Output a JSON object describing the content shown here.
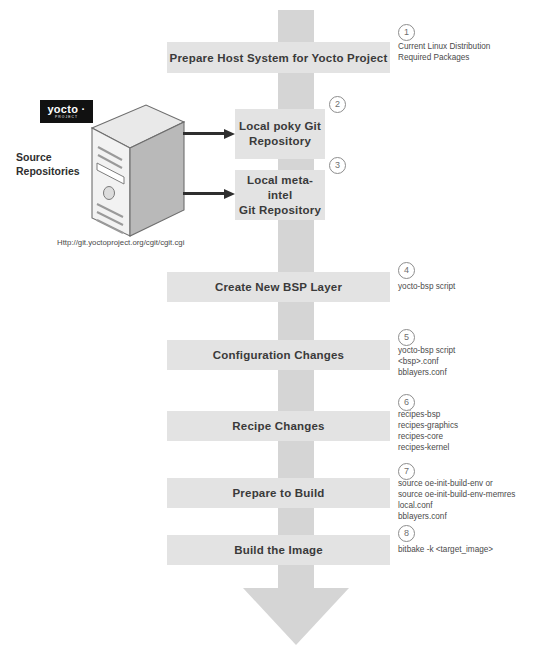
{
  "diagram": {
    "colors": {
      "spine": "#d5d5d5",
      "box": "#e3e3e3",
      "text": "#3a3a3a",
      "annotation": "#4a4a4a",
      "arrow": "#2f2f2f",
      "logo_bg": "#111111"
    }
  },
  "source": {
    "logo_word": "yocto ·",
    "logo_sub": "PROJECT",
    "label": "Source\nRepositories",
    "label_line1": "Source",
    "label_line2": "Repositories",
    "url": "Http://git.yoctoproject.org/cgit/cgit.cgi",
    "server_icon": "server-tower-icon"
  },
  "steps": [
    {
      "number": "1",
      "label": "Prepare Host System for Yocto Project",
      "kind": "wide",
      "annotations": [
        "Current Linux Distribution",
        "Required Packages"
      ]
    },
    {
      "number": "2",
      "label": "Local poky Git Repository",
      "label_lines": [
        "Local poky Git",
        "Repository"
      ],
      "kind": "repo",
      "annotations": []
    },
    {
      "number": "3",
      "label": "Local meta-intel Git Repository",
      "label_lines": [
        "Local meta-intel",
        "Git Repository"
      ],
      "kind": "repo",
      "annotations": []
    },
    {
      "number": "4",
      "label": "Create New BSP Layer",
      "kind": "mid",
      "annotations": [
        "yocto-bsp script"
      ]
    },
    {
      "number": "5",
      "label": "Configuration Changes",
      "kind": "mid",
      "annotations": [
        "yocto-bsp script",
        "<bsp>.conf",
        "bblayers.conf"
      ]
    },
    {
      "number": "6",
      "label": "Recipe Changes",
      "kind": "mid",
      "annotations": [
        "recipes-bsp",
        "recipes-graphics",
        "recipes-core",
        "recipes-kernel"
      ]
    },
    {
      "number": "7",
      "label": "Prepare to Build",
      "kind": "mid",
      "annotations": [
        "source oe-init-build-env or",
        "source oe-init-build-env-memres",
        "local.conf",
        "bblayers.conf"
      ]
    },
    {
      "number": "8",
      "label": "Build the Image",
      "kind": "mid",
      "annotations": [
        "bitbake -k <target_image>"
      ]
    }
  ]
}
